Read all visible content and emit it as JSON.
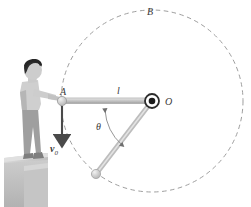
{
  "figure": {
    "type": "physics-diagram",
    "background_color": "#ffffff",
    "labels": {
      "point_a": "A",
      "point_b": "B",
      "point_o": "O",
      "rod_length": "l",
      "angle": "θ",
      "velocity": "v",
      "velocity_subscript": "0"
    },
    "colors": {
      "rod": "#b9b9b9",
      "rod_edge": "#8e8e8e",
      "dashed_circle": "#9a9a9a",
      "label_text": "#3a3a3a",
      "platform_top": "#c8c8c8",
      "platform_face": "#bdbdbd",
      "hair": "#2e2e2e",
      "shirt": "#d4d4d4",
      "pants": "#9f9f9f",
      "skin": "#cfcfcf",
      "arrow": "#4a4a4a"
    },
    "geometry": {
      "pivot_o": {
        "x": 152,
        "y": 101
      },
      "point_a": {
        "x": 62,
        "y": 101
      },
      "circle_radius": 91,
      "ball_lower": {
        "x": 96,
        "y": 174
      },
      "angle_degrees": 127
    },
    "elements": {
      "horizontal_rod": "rod from A to O",
      "slanted_rod": "rod from O to ball below",
      "dashed_circle": "circular trajectory of the ball",
      "velocity_arrow": "downward initial velocity arrow at A",
      "angle_arc": "arc indicating angle theta at O",
      "person": "person standing on ledge holding rod",
      "platform": "L-shaped ledge block"
    }
  }
}
